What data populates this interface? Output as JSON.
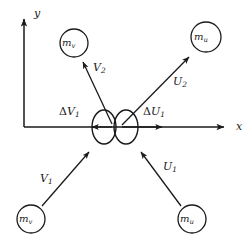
{
  "figure": {
    "type": "physics-collision-diagram",
    "background_color": "#ffffff",
    "stroke_color": "#1a1a1a",
    "width": 251,
    "height": 246
  },
  "axes": {
    "x_label": "x",
    "y_label": "y",
    "origin": {
      "x": 24,
      "y": 127
    },
    "x_axis_end": {
      "x": 228,
      "y": 127
    },
    "y_axis_end": {
      "x": 24,
      "y": 14
    }
  },
  "bodies": [
    {
      "id": "mv-top",
      "label_base": "m",
      "label_sub": "v",
      "cx": 74,
      "cy": 43,
      "r": 14,
      "role": "outgoing-mass-v"
    },
    {
      "id": "mu-top",
      "label_base": "m",
      "label_sub": "u",
      "cx": 206,
      "cy": 37,
      "r": 15,
      "role": "outgoing-mass-u"
    },
    {
      "id": "mv-bottom",
      "label_base": "m",
      "label_sub": "v",
      "cx": 31,
      "cy": 219,
      "r": 14,
      "role": "incoming-mass-v"
    },
    {
      "id": "mu-bottom",
      "label_base": "m",
      "label_sub": "u",
      "cx": 192,
      "cy": 219,
      "r": 14,
      "role": "incoming-mass-u"
    }
  ],
  "collision": {
    "left_ellipse": {
      "cx": 104,
      "cy": 127,
      "rx": 12,
      "ry": 17
    },
    "right_ellipse": {
      "cx": 126,
      "cy": 127,
      "rx": 12,
      "ry": 17
    }
  },
  "vectors": [
    {
      "id": "V1",
      "label_base": "V",
      "label_sub": "1",
      "label_x": 40,
      "label_y": 173,
      "from": {
        "x": 42,
        "y": 206
      },
      "to": {
        "x": 93,
        "y": 148
      },
      "role": "incoming-velocity-v"
    },
    {
      "id": "U1",
      "label_base": "U",
      "label_sub": "1",
      "label_x": 163,
      "label_y": 161,
      "from": {
        "x": 181,
        "y": 206
      },
      "to": {
        "x": 137,
        "y": 148
      },
      "role": "incoming-velocity-u"
    },
    {
      "id": "V2",
      "label_base": "V",
      "label_sub": "2",
      "label_x": 93,
      "label_y": 62,
      "from": {
        "x": 112,
        "y": 124
      },
      "to": {
        "x": 80,
        "y": 58
      },
      "role": "outgoing-velocity-v"
    },
    {
      "id": "U2",
      "label_base": "U",
      "label_sub": "2",
      "label_x": 173,
      "label_y": 76,
      "from": {
        "x": 122,
        "y": 125
      },
      "to": {
        "x": 192,
        "y": 54
      },
      "role": "outgoing-velocity-u"
    },
    {
      "id": "dV1",
      "label_prefix": "Δ",
      "label_base": "V",
      "label_sub": "1",
      "label_x": 59,
      "label_y": 106,
      "from": {
        "x": 112,
        "y": 127
      },
      "to": {
        "x": 88,
        "y": 127
      },
      "role": "impulse-component-v"
    },
    {
      "id": "dU1",
      "label_prefix": "Δ",
      "label_base": "U",
      "label_sub": "1",
      "label_x": 143,
      "label_y": 106,
      "from": {
        "x": 122,
        "y": 127
      },
      "to": {
        "x": 166,
        "y": 127
      },
      "role": "impulse-component-u"
    }
  ]
}
